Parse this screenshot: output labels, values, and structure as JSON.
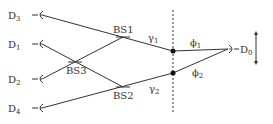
{
  "detectors": [
    {
      "id": "D3",
      "base": "D",
      "sub": "3",
      "x": 40,
      "y": 15
    },
    {
      "id": "D1",
      "base": "D",
      "sub": "1",
      "x": 40,
      "y": 44
    },
    {
      "id": "D2",
      "base": "D",
      "sub": "2",
      "x": 40,
      "y": 79
    },
    {
      "id": "D4",
      "base": "D",
      "sub": "4",
      "x": 40,
      "y": 108
    }
  ],
  "beam_splitters": [
    {
      "label": "BS1",
      "x": 123,
      "y": 37
    },
    {
      "label": "BS2",
      "x": 123,
      "y": 87
    },
    {
      "label": "BS3",
      "x": 75,
      "y": 62
    }
  ],
  "gamma_labels": [
    {
      "base": "γ",
      "sub": "1"
    },
    {
      "base": "γ",
      "sub": "2"
    }
  ],
  "phi_labels": [
    {
      "base": "ϕ",
      "sub": "1"
    },
    {
      "base": "ϕ",
      "sub": "2"
    }
  ],
  "d0": {
    "base": "D",
    "sub": "0"
  },
  "colors": {
    "line": "#333333",
    "dot": "#111111"
  }
}
